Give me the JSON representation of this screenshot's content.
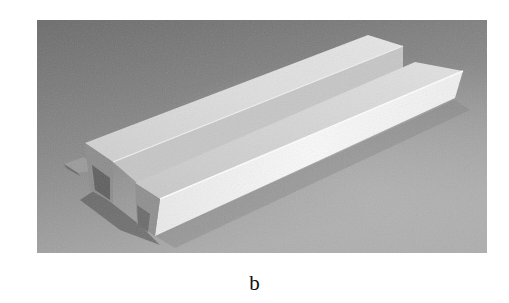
{
  "figure": {
    "panel_label": "b",
    "image": {
      "description": "Grayscale photograph of two white folded rectangular channel profiles lying side by side on a grey surface",
      "colors": {
        "background_dark": "#6e6e6e",
        "background_light": "#a9a9a9",
        "beam_top": "#d6d6d6",
        "beam_side_bright": "#f2f2f2",
        "beam_shadow": "#4a4a4a"
      }
    }
  }
}
